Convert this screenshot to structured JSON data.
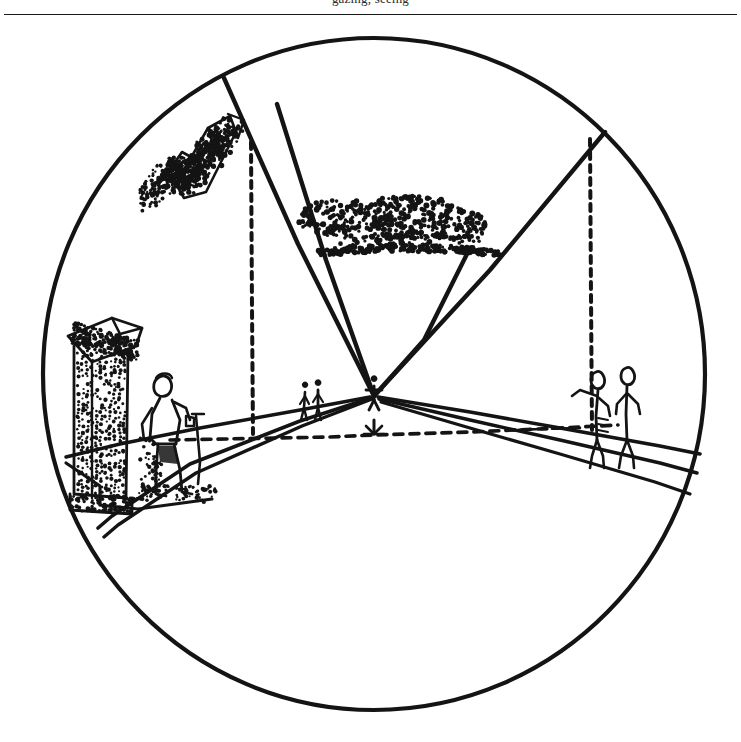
{
  "page": {
    "running_head": "gazing, seeing",
    "background_color": "#ffffff",
    "ink_color": "#141414",
    "width": 741,
    "height": 742
  },
  "figure": {
    "name": "circular-perspective-field-diagram",
    "circle": {
      "cx": 374,
      "cy": 358,
      "rx": 331,
      "ry": 336,
      "stroke_width": 4.2
    },
    "vanishing_point": {
      "x": 374,
      "y": 380
    },
    "horizon": {
      "label": "horizon-line",
      "style": "dashed",
      "y": 423,
      "x_start": 168,
      "x_end": 618
    },
    "wedges": [
      {
        "name": "left-wedge-edge",
        "x1": 374,
        "y1": 380,
        "x2": 224,
        "y2": 78
      },
      {
        "name": "center-wedge-edge",
        "x1": 374,
        "y1": 380,
        "x2": 276,
        "y2": 103
      },
      {
        "name": "right-wedge-edge",
        "x1": 374,
        "y1": 380,
        "x2": 604,
        "y2": 131
      },
      {
        "name": "right-wedge-edge-2",
        "x1": 374,
        "y1": 380,
        "x2": 468,
        "y2": 245
      }
    ],
    "dashed_verticals": [
      {
        "name": "left-dashed-vertical",
        "x": 252,
        "y_top": 140,
        "y_bottom": 432
      },
      {
        "name": "right-dashed-vertical",
        "x": 591,
        "y_top": 137,
        "y_bottom": 430
      }
    ],
    "elements": [
      {
        "name": "tilted-column-upper-left",
        "type": "stippled-building",
        "cx": 196,
        "cy": 145
      },
      {
        "name": "foliage-mass-upper-center",
        "type": "stipple-cloud",
        "cx": 392,
        "cy": 208
      },
      {
        "name": "column-left-foreground",
        "type": "stippled-building",
        "cx": 103,
        "cy": 400
      },
      {
        "name": "walking-figure-with-cane",
        "type": "human-figure",
        "cx": 166,
        "cy": 420
      },
      {
        "name": "pair-of-figures-left-path",
        "type": "human-figure-pair",
        "cx": 313,
        "cy": 385
      },
      {
        "name": "pair-of-figures-right-path",
        "type": "human-figure-pair",
        "cx": 612,
        "cy": 383
      },
      {
        "name": "figure-at-vanishing-point",
        "type": "human-figure-tiny",
        "cx": 374,
        "cy": 380
      },
      {
        "name": "marker-on-horizon",
        "type": "tick-marker",
        "cx": 374,
        "cy": 414
      },
      {
        "name": "left-road-edges",
        "type": "converging-lines"
      },
      {
        "name": "right-road-edges",
        "type": "converging-lines"
      },
      {
        "name": "left-kerb",
        "type": "ground-edge"
      }
    ]
  }
}
